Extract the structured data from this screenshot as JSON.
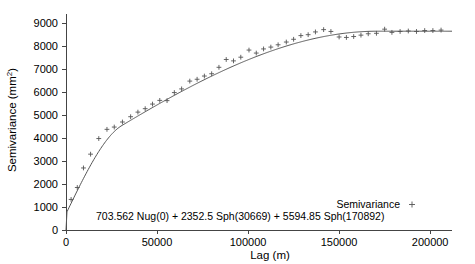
{
  "chart_data": {
    "type": "scatter",
    "title": "",
    "xlabel": "Lag (m)",
    "ylabel": "Semivariance (mm2)",
    "ylabel_base": "Semivariance (mm",
    "ylabel_sup": "2",
    "ylabel_tail": ")",
    "xlim": [
      0,
      212000
    ],
    "ylim": [
      0,
      9400
    ],
    "xticks": [
      0,
      50000,
      100000,
      150000,
      200000
    ],
    "xtick_labels": [
      "0",
      "50000",
      "100000",
      "150000",
      "200000"
    ],
    "yticks": [
      0,
      1000,
      2000,
      3000,
      4000,
      5000,
      6000,
      7000,
      8000,
      9000
    ],
    "ytick_labels": [
      "0",
      "1000",
      "2000",
      "3000",
      "4000",
      "5000",
      "6000",
      "7000",
      "8000",
      "9000"
    ],
    "grid": false,
    "legend_position": "bottom-right",
    "series": [
      {
        "name": "Semivariance",
        "type": "scatter",
        "marker": "+",
        "color": "#555555",
        "points": [
          [
            2800,
            1330
          ],
          [
            6200,
            1850
          ],
          [
            9600,
            2700
          ],
          [
            13500,
            3300
          ],
          [
            18000,
            3980
          ],
          [
            22500,
            4380
          ],
          [
            26500,
            4480
          ],
          [
            31000,
            4700
          ],
          [
            35500,
            4930
          ],
          [
            39500,
            5130
          ],
          [
            43500,
            5280
          ],
          [
            47500,
            5480
          ],
          [
            51500,
            5640
          ],
          [
            55500,
            5630
          ],
          [
            59500,
            5980
          ],
          [
            63500,
            6140
          ],
          [
            68000,
            6480
          ],
          [
            72000,
            6560
          ],
          [
            76000,
            6700
          ],
          [
            80000,
            6800
          ],
          [
            84000,
            7080
          ],
          [
            88000,
            7420
          ],
          [
            92000,
            7360
          ],
          [
            96000,
            7520
          ],
          [
            100500,
            7830
          ],
          [
            104500,
            7700
          ],
          [
            108500,
            7880
          ],
          [
            112500,
            7960
          ],
          [
            116500,
            8060
          ],
          [
            121000,
            8180
          ],
          [
            125000,
            8300
          ],
          [
            129000,
            8460
          ],
          [
            133000,
            8500
          ],
          [
            137000,
            8620
          ],
          [
            141500,
            8720
          ],
          [
            145500,
            8640
          ],
          [
            150000,
            8400
          ],
          [
            154000,
            8380
          ],
          [
            158000,
            8420
          ],
          [
            162000,
            8480
          ],
          [
            166000,
            8540
          ],
          [
            170500,
            8560
          ],
          [
            175000,
            8740
          ],
          [
            179000,
            8600
          ],
          [
            183500,
            8640
          ],
          [
            188000,
            8660
          ],
          [
            192500,
            8640
          ],
          [
            197000,
            8680
          ],
          [
            201500,
            8680
          ],
          [
            206000,
            8700
          ]
        ]
      },
      {
        "name": "Fitted model",
        "type": "line",
        "color": "#555555",
        "model": "703.562 Nug(0) + 2352.5 Sph(30669) + 5594.85 Sph(170892)",
        "nugget": 703.562,
        "components": [
          {
            "sill": 2352.5,
            "range": 30669,
            "model": "Sph"
          },
          {
            "sill": 5594.85,
            "range": 170892,
            "model": "Sph"
          }
        ],
        "total_sill": 8650.912
      }
    ],
    "annotations": [
      {
        "name": "model-equation",
        "text": "703.562 Nug(0) + 2352.5 Sph(30669) + 5594.85 Sph(170892)"
      }
    ],
    "legend": [
      {
        "label": "Semivariance",
        "marker": "+",
        "color": "#555555"
      }
    ]
  },
  "colors": {
    "axis": "#444444",
    "data": "#555555",
    "background": "#ffffff"
  }
}
